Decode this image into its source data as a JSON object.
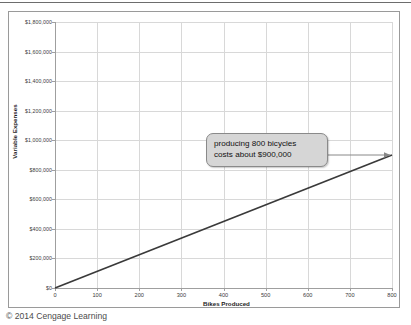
{
  "figure": {
    "credit": "© 2014 Cengage Learning"
  },
  "chart_data": {
    "type": "line",
    "title": "",
    "xlabel": "Bikes Produced",
    "ylabel": "Variable Expenses",
    "xlim": [
      0,
      800
    ],
    "ylim": [
      0,
      1800000
    ],
    "grid": true,
    "legend": "none",
    "x_ticks": [
      0,
      100,
      200,
      300,
      400,
      500,
      600,
      700,
      800
    ],
    "x_tick_labels": [
      "0",
      "100",
      "200",
      "300",
      "400",
      "500",
      "600",
      "700",
      "800"
    ],
    "y_ticks": [
      0,
      200000,
      400000,
      600000,
      800000,
      1000000,
      1200000,
      1400000,
      1600000,
      1800000
    ],
    "y_tick_labels": [
      "$0",
      "$200,000",
      "$400,000",
      "$600,000",
      "$800,000",
      "$1,000,000",
      "$1,200,000",
      "$1,400,000",
      "$1,600,000",
      "$1,800,000"
    ],
    "series": [
      {
        "name": "Variable Expenses",
        "color": "#3a3a3a",
        "x": [
          0,
          800
        ],
        "values": [
          0,
          900000
        ],
        "slope_per_unit": 1125
      }
    ],
    "annotations": [
      {
        "name": "callout-800-bicycles",
        "lines": [
          "producing 800 bicycles",
          "costs about $900,000"
        ],
        "points_to_x": 800,
        "points_to_y": 900000,
        "arrow": "right"
      }
    ]
  }
}
